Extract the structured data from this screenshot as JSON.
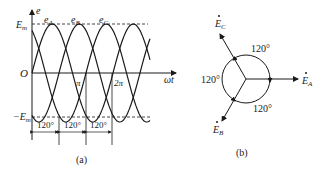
{
  "panel_a": {
    "y_axis_label": "e",
    "x_axis_label": "ωt",
    "origin_label": "O",
    "top_level_label": "E",
    "top_level_sub": "m",
    "bottom_level_label": "−E",
    "bottom_level_sub": "m",
    "pi_label": "π",
    "two_pi_label": "2π",
    "curves": [
      {
        "name": "e",
        "sub": "A",
        "phase_deg": 0
      },
      {
        "name": "e",
        "sub": "B",
        "phase_deg": -120
      },
      {
        "name": "e",
        "sub": "C",
        "phase_deg": 120
      }
    ],
    "spacing_labels": [
      "120°",
      "120°",
      "120°"
    ],
    "caption": "(a)"
  },
  "panel_b": {
    "phasors": [
      {
        "name": "E",
        "sub": "A",
        "angle_deg": 0
      },
      {
        "name": "E",
        "sub": "B",
        "angle_deg": 240
      },
      {
        "name": "E",
        "sub": "C",
        "angle_deg": 120
      }
    ],
    "angle_labels": [
      "120°",
      "120°",
      "120°"
    ],
    "caption": "(b)"
  }
}
